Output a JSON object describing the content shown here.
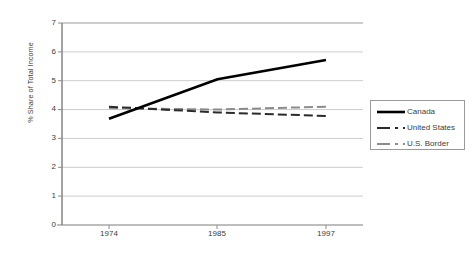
{
  "chart_data": {
    "type": "line",
    "title": "",
    "subtitle": "",
    "xlabel": "",
    "ylabel": "% Share of Total Income",
    "x": [
      1974,
      1985,
      1997
    ],
    "categories": [
      "1974",
      "1985",
      "1997"
    ],
    "xtick_labels": [
      "1974",
      "1985",
      "1997"
    ],
    "ytick_labels": [
      "0",
      "1",
      "2",
      "3",
      "4",
      "5",
      "6",
      "7"
    ],
    "ytick_values": [
      0,
      1,
      2,
      3,
      4,
      5,
      6,
      7
    ],
    "ylim": [
      0,
      7
    ],
    "xlim": [
      1971,
      2000
    ],
    "grid": "horizontal",
    "legend_position": "right",
    "series": [
      {
        "name": "Canada",
        "values": [
          3.68,
          5.05,
          5.72
        ],
        "style": "solid",
        "color": "#000000",
        "width": 2.6
      },
      {
        "name": "United States",
        "values": [
          4.1,
          3.9,
          3.78
        ],
        "style": "dashed",
        "color": "#2b2b2b",
        "width": 2.0
      },
      {
        "name": "U.S. Border",
        "values": [
          4.05,
          4.0,
          4.1
        ],
        "style": "dashed",
        "color": "#8c8c8c",
        "width": 2.0
      }
    ],
    "colors": {
      "axis": "#808080",
      "grid": "#c8c8c8",
      "text": "#3d3d3d",
      "background": "#ffffff"
    }
  },
  "legend": {
    "items": [
      {
        "label": "Canada"
      },
      {
        "label": "United States"
      },
      {
        "label": "U.S. Border"
      }
    ]
  }
}
